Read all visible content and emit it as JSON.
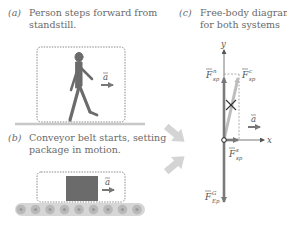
{
  "panels": {
    "a": {
      "tag": "(a)",
      "line1": "Person steps forward from",
      "line2": "standstill.",
      "accel_label": "a"
    },
    "b": {
      "tag": "(b)",
      "line1": "Conveyor belt starts, setting",
      "line2": "package in motion.",
      "accel_label": "a"
    },
    "c": {
      "tag": "(c)",
      "line1": "Free-body diagram",
      "line2": "for both systems",
      "axes": {
        "x": "x",
        "y": "y"
      },
      "forces": {
        "normal": {
          "symbol": "F",
          "sup": "n",
          "sub": "sp"
        },
        "contact": {
          "symbol": "F",
          "sup": "c",
          "sub": "sp"
        },
        "friction": {
          "symbol": "F",
          "sup": "s",
          "sub": "sp"
        },
        "gravity": {
          "symbol": "F",
          "sup": "G",
          "sub": "Ep"
        }
      },
      "accel_label": "a"
    }
  },
  "colors": {
    "figure": "#6b6b6b",
    "force_dark": "#7a7a7a",
    "force_light": "#bdbdbd",
    "dashed_box": "#8a8a8a",
    "floor": "#c8c8c8",
    "big_arrow": "#d4d4d4",
    "roller_fill": "#b9b9b9",
    "roller_center": "#9a9a9a"
  }
}
